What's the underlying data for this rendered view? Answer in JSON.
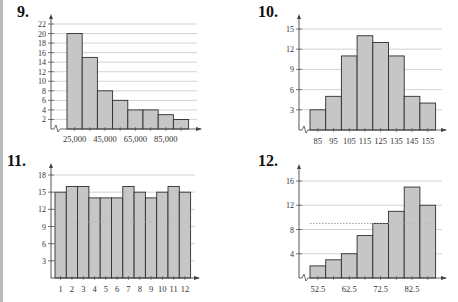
{
  "colors": {
    "bar_fill": "#c6c6c6",
    "bar_stroke": "#2e2e2e",
    "grid": "#c8c8c8",
    "axis": "#444444",
    "dotted_line": "#9a9a9a",
    "left_rule": "#b9b9b9"
  },
  "chart_data": [
    {
      "id": "9",
      "label": "9.",
      "type": "bar",
      "title": "",
      "xlabel": "",
      "ylabel": "",
      "categories": [
        "25,000",
        "35,000",
        "45,000",
        "55,000",
        "65,000",
        "75,000",
        "85,000",
        "95,000"
      ],
      "x_tick_labels": [
        "25,000",
        "45,000",
        "65,000",
        "85,000"
      ],
      "values": [
        20,
        15,
        8,
        6,
        4,
        4,
        3,
        2
      ],
      "y_ticks": [
        2,
        4,
        6,
        8,
        10,
        12,
        14,
        16,
        18,
        20,
        22
      ],
      "ylim": [
        0,
        22
      ],
      "grid": true,
      "axis_break": true
    },
    {
      "id": "10",
      "label": "10.",
      "type": "bar",
      "title": "",
      "xlabel": "",
      "ylabel": "",
      "categories": [
        "85",
        "95",
        "105",
        "115",
        "125",
        "135",
        "145",
        "155"
      ],
      "x_tick_labels": [
        "85",
        "95",
        "105",
        "115",
        "125",
        "135",
        "145",
        "155"
      ],
      "values": [
        3,
        5,
        11,
        14,
        13,
        11,
        5,
        4
      ],
      "y_ticks": [
        3,
        6,
        9,
        12,
        15
      ],
      "ylim": [
        0,
        15
      ],
      "grid": true,
      "axis_break": true
    },
    {
      "id": "11",
      "label": "11.",
      "type": "bar",
      "title": "",
      "xlabel": "",
      "ylabel": "",
      "categories": [
        "1",
        "2",
        "3",
        "4",
        "5",
        "6",
        "7",
        "8",
        "9",
        "10",
        "11",
        "12"
      ],
      "x_tick_labels": [
        "1",
        "2",
        "3",
        "4",
        "5",
        "6",
        "7",
        "8",
        "9",
        "10",
        "11",
        "12"
      ],
      "values": [
        15,
        16,
        16,
        14,
        14,
        14,
        16,
        15,
        14,
        15,
        16,
        15
      ],
      "y_ticks": [
        3,
        6,
        9,
        12,
        15,
        18
      ],
      "ylim": [
        0,
        18
      ],
      "grid": true,
      "dotted_reference_y": 9.8,
      "axis_break": false
    },
    {
      "id": "12",
      "label": "12.",
      "type": "bar",
      "title": "",
      "xlabel": "",
      "ylabel": "",
      "categories": [
        "52.5",
        "57.5",
        "62.5",
        "67.5",
        "72.5",
        "77.5",
        "82.5",
        "87.5"
      ],
      "x_tick_labels": [
        "52.5",
        "62.5",
        "72.5",
        "82.5"
      ],
      "values": [
        2,
        3,
        4,
        7,
        9,
        11,
        15,
        12
      ],
      "y_ticks": [
        4,
        8,
        12,
        16
      ],
      "ylim": [
        0,
        16
      ],
      "grid": true,
      "dotted_reference_y": 9,
      "axis_break": true
    }
  ]
}
